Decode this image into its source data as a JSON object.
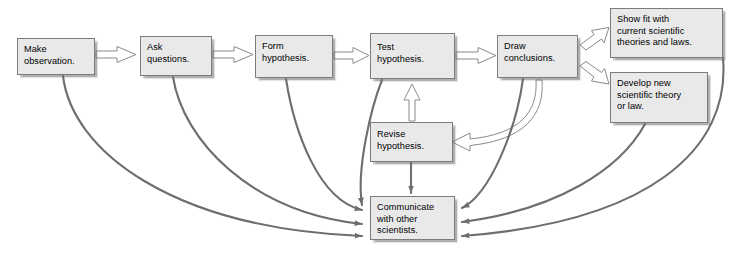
{
  "diagram": {
    "type": "flowchart",
    "canvas": {
      "width": 731,
      "height": 260
    },
    "style": {
      "box_fill": "#e9e9e9",
      "box_border": "#7c7c7c",
      "text_color": "#000000",
      "block_arrow_fill": "#ffffff",
      "block_arrow_stroke": "#8a8a8a",
      "curve_stroke": "#6e6e6e",
      "background": "#ffffff"
    },
    "nodes": [
      {
        "id": "observe",
        "label": "Make\nobservation.",
        "x": 17,
        "y": 38,
        "w": 78,
        "h": 37
      },
      {
        "id": "ask",
        "label": "Ask\nquestions.",
        "x": 140,
        "y": 36,
        "w": 72,
        "h": 40
      },
      {
        "id": "form",
        "label": "Form\nhypothesis.",
        "x": 255,
        "y": 35,
        "w": 78,
        "h": 43
      },
      {
        "id": "test",
        "label": "Test\nhypothesis.",
        "x": 370,
        "y": 33,
        "w": 85,
        "h": 46
      },
      {
        "id": "draw",
        "label": "Draw\nconclusions.",
        "x": 497,
        "y": 35,
        "w": 81,
        "h": 43
      },
      {
        "id": "showfit",
        "label": "Show fit with\ncurrent scientific\ntheories and laws.",
        "x": 610,
        "y": 8,
        "w": 113,
        "h": 50
      },
      {
        "id": "develop",
        "label": "Develop new\nscientific theory\nor law.",
        "x": 610,
        "y": 72,
        "w": 98,
        "h": 51
      },
      {
        "id": "revise",
        "label": "Revise\nhypothesis.",
        "x": 370,
        "y": 122,
        "w": 83,
        "h": 40
      },
      {
        "id": "communicate",
        "label": "Communicate\nwith other\nscientists.",
        "x": 370,
        "y": 196,
        "w": 85,
        "h": 44
      }
    ],
    "edges": [
      {
        "from": "observe",
        "to": "ask",
        "kind": "block-arrow"
      },
      {
        "from": "ask",
        "to": "form",
        "kind": "block-arrow"
      },
      {
        "from": "form",
        "to": "test",
        "kind": "block-arrow"
      },
      {
        "from": "test",
        "to": "draw",
        "kind": "block-arrow"
      },
      {
        "from": "draw",
        "to": "showfit",
        "kind": "block-arrow"
      },
      {
        "from": "draw",
        "to": "develop",
        "kind": "block-arrow"
      },
      {
        "from": "revise",
        "to": "test",
        "kind": "block-arrow"
      },
      {
        "from": "draw",
        "to": "revise",
        "kind": "block-curve"
      },
      {
        "from": "revise",
        "to": "communicate",
        "kind": "line-arrow"
      },
      {
        "from": "observe",
        "to": "communicate",
        "kind": "curve-arrow"
      },
      {
        "from": "ask",
        "to": "communicate",
        "kind": "curve-arrow"
      },
      {
        "from": "form",
        "to": "communicate",
        "kind": "curve-arrow"
      },
      {
        "from": "test",
        "to": "communicate",
        "kind": "curve-arrow"
      },
      {
        "from": "draw",
        "to": "communicate",
        "kind": "curve-arrow"
      },
      {
        "from": "showfit",
        "to": "communicate",
        "kind": "curve-arrow"
      },
      {
        "from": "develop",
        "to": "communicate",
        "kind": "curve-arrow"
      }
    ]
  }
}
